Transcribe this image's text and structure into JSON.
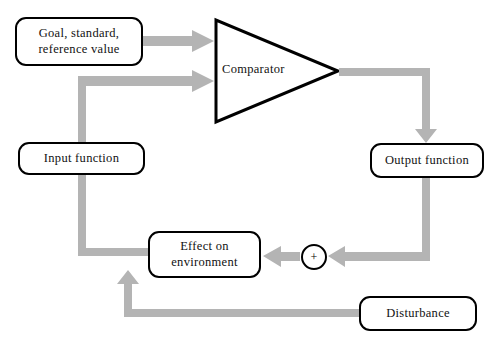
{
  "diagram": {
    "colors": {
      "arrow": "#b4b4b4",
      "outline": "#000000",
      "background": "#ffffff"
    },
    "nodes": {
      "goal": {
        "label": "Goal, standard,\nreference value"
      },
      "input_function": {
        "label": "Input function"
      },
      "comparator": {
        "label": "Comparator"
      },
      "output_function": {
        "label": "Output function"
      },
      "effect": {
        "label": "Effect on\nenvironment"
      },
      "disturbance": {
        "label": "Disturbance"
      },
      "summing_junction": {
        "label": "+"
      }
    },
    "connections": [
      {
        "from": "goal",
        "to": "comparator"
      },
      {
        "from": "input_function",
        "to": "comparator"
      },
      {
        "from": "comparator",
        "to": "output_function"
      },
      {
        "from": "output_function",
        "to": "summing_junction"
      },
      {
        "from": "disturbance",
        "to": "summing_junction"
      },
      {
        "from": "summing_junction",
        "to": "effect"
      },
      {
        "from": "effect",
        "to": "input_function"
      }
    ]
  }
}
